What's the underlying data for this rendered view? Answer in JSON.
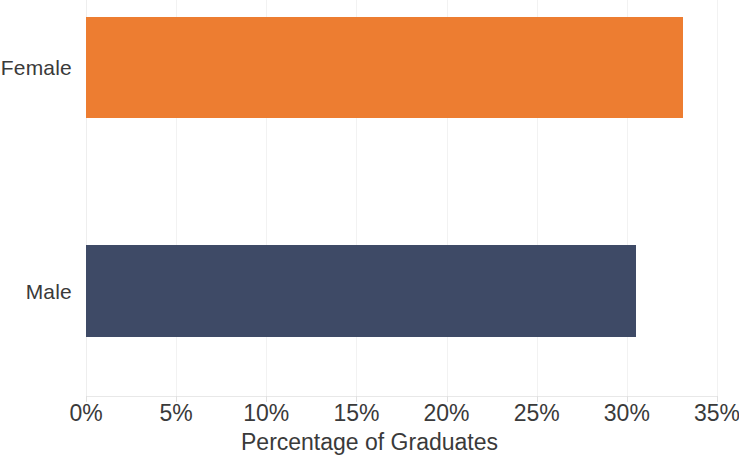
{
  "chart_data": {
    "type": "bar",
    "orientation": "horizontal",
    "title": "",
    "xlabel": "Percentage of Graduates",
    "ylabel": "",
    "categories": [
      "Female",
      "Male"
    ],
    "values": [
      33.1,
      30.5
    ],
    "value_unit": "%",
    "xlim": [
      0,
      35
    ],
    "x_tick_labels": [
      "0%",
      "5%",
      "10%",
      "15%",
      "20%",
      "25%",
      "30%",
      "35%"
    ],
    "x_tick_values": [
      0,
      5,
      10,
      15,
      20,
      25,
      30,
      35
    ],
    "grid": true,
    "grid_axis": "x",
    "legend": false,
    "series": [
      {
        "name": "Female",
        "value": 33.1,
        "color": "#ED7D31"
      },
      {
        "name": "Male",
        "value": 30.5,
        "color": "#3E4A66"
      }
    ]
  },
  "colors": {
    "female_bar": "#ED7D31",
    "male_bar": "#3E4A66",
    "gridline": "#f2f2f2",
    "text": "#3a3a3a",
    "background": "#ffffff"
  },
  "axis": {
    "x_title": "Percentage of Graduates"
  },
  "categories": {
    "female_label": "Female",
    "male_label": "Male"
  },
  "ticks": {
    "t0": "0%",
    "t1": "5%",
    "t2": "10%",
    "t3": "15%",
    "t4": "20%",
    "t5": "25%",
    "t6": "30%",
    "t7": "35%"
  }
}
